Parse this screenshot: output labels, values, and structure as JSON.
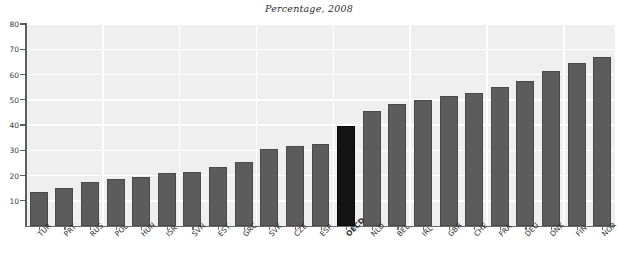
{
  "chart_data": {
    "type": "bar",
    "title": "Percentage, 2008",
    "subtitle": "",
    "xlabel": "",
    "ylabel": "",
    "ylim": [
      0,
      80
    ],
    "yticks": [
      0,
      10,
      20,
      30,
      40,
      50,
      60,
      70,
      80
    ],
    "ytick_labels": [
      "0",
      "10",
      "20",
      "30",
      "40",
      "50",
      "60",
      "70",
      "80"
    ],
    "grid": true,
    "legend": "none",
    "bar_color": "#5c5c5c",
    "highlight_color": "#131313",
    "highlight_category": "OECD",
    "plot_background": "#efefef",
    "categories": [
      "TUR",
      "PRT",
      "RUS",
      "POL",
      "HUN",
      "ISR",
      "SVN",
      "EST",
      "GRC",
      "SVK",
      "CZE",
      "ESP",
      "OECD",
      "NLD",
      "BEL",
      "IRL",
      "GBR",
      "CHE",
      "FRA",
      "DEU",
      "DNK",
      "FIN",
      "NOR"
    ],
    "values": [
      13.5,
      15.0,
      17.5,
      18.5,
      19.5,
      21.0,
      21.5,
      23.5,
      25.5,
      30.5,
      31.5,
      32.5,
      39.5,
      45.5,
      48.5,
      50.0,
      51.5,
      52.5,
      55.0,
      57.5,
      61.5,
      64.5,
      67.0
    ],
    "series": [
      {
        "name": "Percentage, 2008",
        "values": [
          13.5,
          15.0,
          17.5,
          18.5,
          19.5,
          21.0,
          21.5,
          23.5,
          25.5,
          30.5,
          31.5,
          32.5,
          39.5,
          45.5,
          48.5,
          50.0,
          51.5,
          52.5,
          55.0,
          57.5,
          61.5,
          64.5,
          67.0
        ]
      }
    ]
  }
}
